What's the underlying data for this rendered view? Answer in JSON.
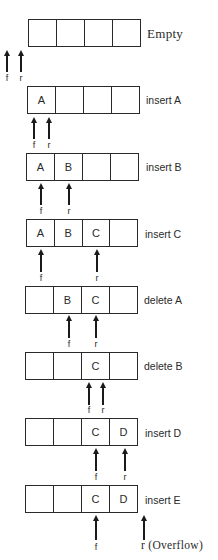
{
  "diagram": {
    "capacity": 4,
    "states": [
      {
        "operation": "Empty",
        "cells": [
          "",
          "",
          "",
          ""
        ],
        "front_label": "f",
        "rear_label": "r"
      },
      {
        "operation": "insert A",
        "cells": [
          "A",
          "",
          "",
          ""
        ],
        "front_label": "f",
        "rear_label": "r"
      },
      {
        "operation": "insert B",
        "cells": [
          "A",
          "B",
          "",
          ""
        ],
        "front_label": "f",
        "rear_label": "r"
      },
      {
        "operation": "insert C",
        "cells": [
          "A",
          "B",
          "C",
          ""
        ],
        "front_label": "f",
        "rear_label": "r"
      },
      {
        "operation": "delete A",
        "cells": [
          "",
          "B",
          "C",
          ""
        ],
        "front_label": "f",
        "rear_label": "r"
      },
      {
        "operation": "delete B",
        "cells": [
          "",
          "",
          "C",
          ""
        ],
        "front_label": "f",
        "rear_label": "r"
      },
      {
        "operation": "insert D",
        "cells": [
          "",
          "",
          "C",
          "D"
        ],
        "front_label": "f",
        "rear_label": "r"
      },
      {
        "operation": "insert E",
        "cells": [
          "",
          "",
          "C",
          "D"
        ],
        "front_label": "f",
        "rear_label": "r (Overflow)"
      }
    ]
  }
}
